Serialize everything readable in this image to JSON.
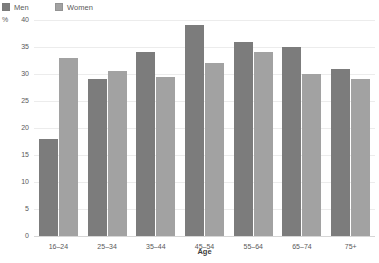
{
  "legend": {
    "items": [
      {
        "label": "Men",
        "color": "#7c7c7c",
        "icon": "legend-swatch-icon"
      },
      {
        "label": "Women",
        "color": "#a2a2a2",
        "icon": "legend-swatch-icon"
      }
    ]
  },
  "axis": {
    "unit_label": "%",
    "y_ticks": [
      "40",
      "35",
      "30",
      "25",
      "20",
      "15",
      "10",
      "5",
      "0"
    ],
    "x_title": "Age"
  },
  "chart_data": {
    "type": "bar",
    "title": "",
    "subtitle": "",
    "xlabel": "Age",
    "ylabel": "%",
    "ylim": [
      0,
      40
    ],
    "ytick_step": 5,
    "grid": true,
    "legend_position": "top-left",
    "categories": [
      "16–24",
      "25–34",
      "35–44",
      "45–54",
      "55–64",
      "65–74",
      "75+"
    ],
    "series": [
      {
        "name": "Men",
        "color": "#7c7c7c",
        "values": [
          18,
          29,
          34,
          39,
          36,
          35,
          31
        ]
      },
      {
        "name": "Women",
        "color": "#a2a2a2",
        "values": [
          33,
          30.5,
          29.5,
          32,
          34,
          30,
          29
        ]
      }
    ]
  }
}
